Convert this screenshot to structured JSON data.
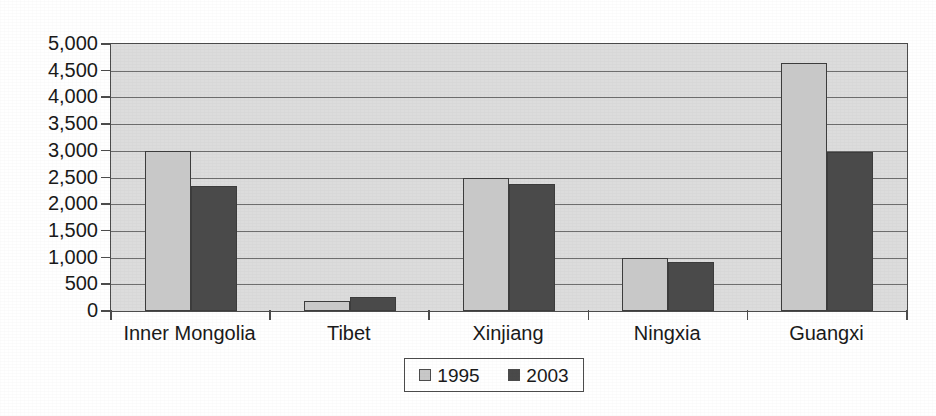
{
  "chart_data": {
    "type": "bar",
    "title": "",
    "subtitle": "",
    "xlabel": "",
    "ylabel": "",
    "categories": [
      "Inner Mongolia",
      "Tibet",
      "Xinjiang",
      "Ningxia",
      "Guangxi"
    ],
    "series": [
      {
        "name": "1995",
        "color": "#c8c8c8",
        "values": [
          3000,
          180,
          2490,
          1000,
          4640
        ]
      },
      {
        "name": "2003",
        "color": "#4a4a4a",
        "values": [
          2350,
          265,
          2380,
          920,
          2980
        ]
      }
    ],
    "ylim": [
      0,
      5000
    ],
    "ytick_step": 500,
    "ytick_labels": [
      "5,000",
      "4,500",
      "4,000",
      "3,500",
      "3,000",
      "2,500",
      "2,000",
      "1,500",
      "1,000",
      "500",
      "0"
    ],
    "ytick_values": [
      5000,
      4500,
      4000,
      3500,
      3000,
      2500,
      2000,
      1500,
      1000,
      500,
      0
    ],
    "grid": true,
    "grid_axis": "y",
    "legend_position": "bottom-center",
    "legend_entries": [
      "1995",
      "2003"
    ],
    "plot_background": "#dcdcdc",
    "gridline_color": "#6e6e6e",
    "axis_color": "#4c4c4c",
    "annotations": []
  }
}
